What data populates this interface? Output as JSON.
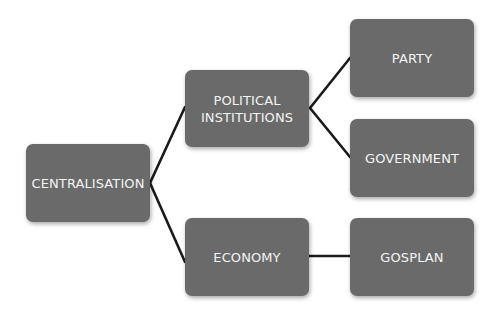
{
  "diagram": {
    "type": "tree",
    "colors": {
      "node_fill": "#6a6a6a",
      "node_text": "#f4f4f4",
      "connector": "#1a1a1a",
      "background": "#ffffff"
    },
    "nodes": {
      "centralisation": {
        "label": "CENTRALISATION"
      },
      "political_institutions": {
        "label_line1": "POLITICAL",
        "label_line2": "INSTITUTIONS"
      },
      "party": {
        "label": "PARTY"
      },
      "government": {
        "label": "GOVERNMENT"
      },
      "economy": {
        "label": "ECONOMY"
      },
      "gosplan": {
        "label": "GOSPLAN"
      }
    },
    "edges": [
      {
        "from": "CENTRALISATION",
        "to": "POLITICAL INSTITUTIONS"
      },
      {
        "from": "CENTRALISATION",
        "to": "ECONOMY"
      },
      {
        "from": "POLITICAL INSTITUTIONS",
        "to": "PARTY"
      },
      {
        "from": "POLITICAL INSTITUTIONS",
        "to": "GOVERNMENT"
      },
      {
        "from": "ECONOMY",
        "to": "GOSPLAN"
      }
    ]
  }
}
